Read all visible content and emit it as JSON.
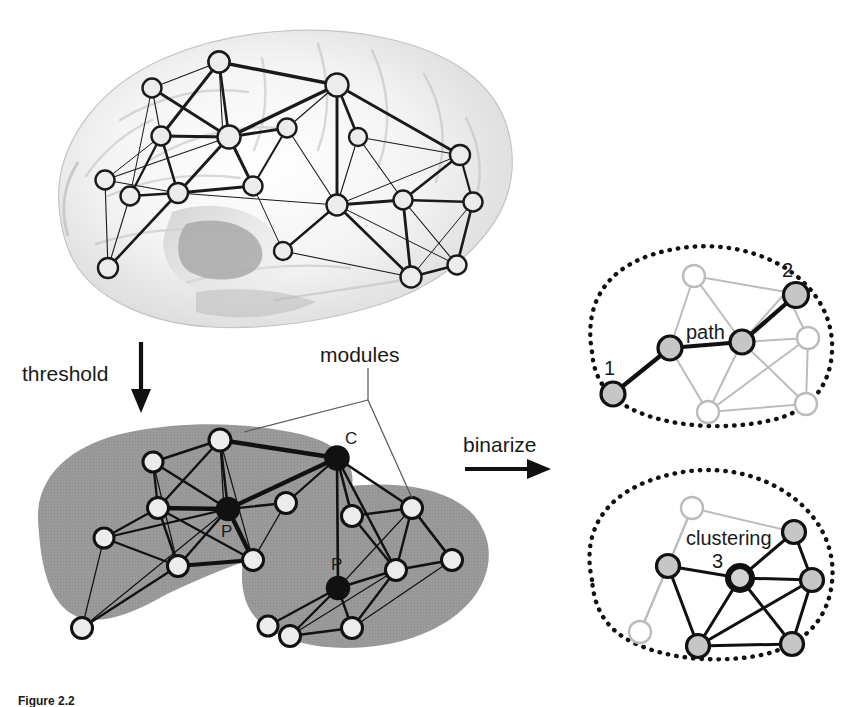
{
  "figure": {
    "caption_partial": "Figure 2.2",
    "background": "#ffffff"
  },
  "colors": {
    "module_fill": "#9a9a9a",
    "node_light": "#ececec",
    "node_gray": "#bdbdbd",
    "node_black": "#111111",
    "edge_dark": "#1a1a1a",
    "edge_light": "#b4b4b4",
    "brain_gray": "#cfcfcf",
    "dotted_outline": "#111111"
  },
  "panels": {
    "brain": {
      "name": "weighted-brain-network",
      "node_count": 20,
      "description": "lateral brain surface with weighted network overlay"
    },
    "modules": {
      "name": "thresholded-modular-network",
      "label": "modules",
      "hub_labels": [
        {
          "id": "connector",
          "text": "C"
        },
        {
          "id": "provincial-left",
          "text": "P"
        },
        {
          "id": "provincial-right",
          "text": "P"
        }
      ],
      "module_count": 2
    },
    "path": {
      "name": "path-length-panel",
      "label": "path",
      "node_labels": [
        "1",
        "2"
      ]
    },
    "clustering": {
      "name": "clustering-panel",
      "label": "clustering",
      "node_labels": [
        "3"
      ]
    }
  },
  "operations": [
    {
      "id": "threshold",
      "label": "threshold",
      "direction": "down"
    },
    {
      "id": "binarize",
      "label": "binarize",
      "direction": "right"
    }
  ]
}
